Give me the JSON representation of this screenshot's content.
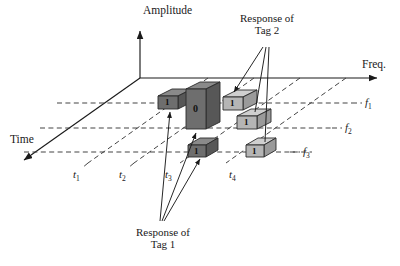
{
  "figure": {
    "type": "3d-axes-diagram",
    "background": "#ffffff",
    "ink": "#1a1a1a"
  },
  "axes": {
    "vertical": {
      "label": "Amplitude",
      "name": "amplitude-axis"
    },
    "horizontal": {
      "label": "Freq.",
      "name": "frequency-axis"
    },
    "depth": {
      "label": "Time",
      "name": "time-axis"
    }
  },
  "freq_ticks": [
    {
      "label": "f",
      "sub": "1"
    },
    {
      "label": "f",
      "sub": "2"
    },
    {
      "label": "f",
      "sub": "3"
    }
  ],
  "time_ticks": [
    {
      "label": "t",
      "sub": "1"
    },
    {
      "label": "t",
      "sub": "2"
    },
    {
      "label": "t",
      "sub": "3"
    },
    {
      "label": "t",
      "sub": "4"
    }
  ],
  "annotations": [
    {
      "name": "response-tag-2",
      "line1": "Response of",
      "line2": "Tag 2"
    },
    {
      "name": "response-tag-1",
      "line1": "Response of",
      "line2": "Tag 1"
    }
  ],
  "bars": [
    {
      "id": "bar-t2-f1",
      "value": "1",
      "shade": "dark",
      "tag": "Tag 1",
      "time": "t2",
      "freq": "f1"
    },
    {
      "id": "bar-t3-f1",
      "value": "0",
      "shade": "dark",
      "tag": "Tag 1",
      "time": "t3",
      "freq": "f1"
    },
    {
      "id": "bar-t4-f1",
      "value": "1",
      "shade": "light",
      "tag": "Tag 2",
      "time": "t4",
      "freq": "f1"
    },
    {
      "id": "bar-t4-f2",
      "value": "1",
      "shade": "light",
      "tag": "Tag 2",
      "time": "t4",
      "freq": "f2"
    },
    {
      "id": "bar-t3-f3",
      "value": "1",
      "shade": "dark",
      "tag": "Tag 1",
      "time": "t3",
      "freq": "f3"
    },
    {
      "id": "bar-t4-f3",
      "value": "1",
      "shade": "light",
      "tag": "Tag 2",
      "time": "t4",
      "freq": "f3"
    }
  ],
  "colors": {
    "dark_front": "#6e6e6e",
    "dark_top": "#8a8a8a",
    "dark_side": "#575757",
    "light_front": "#b5b5b5",
    "light_top": "#cfcfcf",
    "light_side": "#9a9a9a",
    "stroke": "#2a2a2a",
    "dashed": "#3a3a3a"
  }
}
